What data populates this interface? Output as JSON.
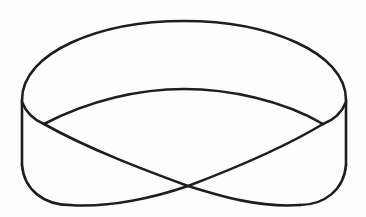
{
  "figure": {
    "subject": "Möbius strip line drawing",
    "stroke_color": "#1e1e1e",
    "background_color": "#fdfdfd"
  }
}
